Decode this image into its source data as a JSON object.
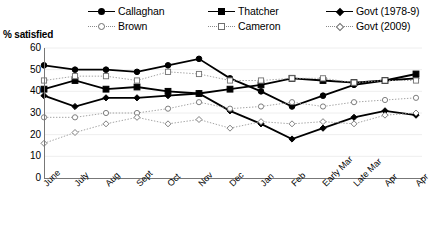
{
  "axis_title": "% satisfied",
  "legend": {
    "rows": [
      [
        {
          "label": "Callaghan",
          "marker": "f-circle",
          "line": "solid"
        },
        {
          "label": "Thatcher",
          "marker": "f-square",
          "line": "solid"
        },
        {
          "label": "Govt (1978-9)",
          "marker": "f-diamond",
          "line": "solid"
        }
      ],
      [
        {
          "label": "Brown",
          "marker": "o-circle",
          "line": "dot"
        },
        {
          "label": "Cameron",
          "marker": "o-square",
          "line": "dot"
        },
        {
          "label": "Govt (2009)",
          "marker": "o-diamond",
          "line": "dot"
        }
      ]
    ]
  },
  "chart_data": {
    "type": "line",
    "title": "",
    "xlabel": "",
    "ylabel": "% satisfied",
    "ylim": [
      0,
      60
    ],
    "yticks": [
      0,
      10,
      20,
      30,
      40,
      50,
      60
    ],
    "grid": true,
    "legend_position": "top",
    "categories": [
      "June",
      "July",
      "Aug",
      "Sept",
      "Oct",
      "Nov",
      "Dec",
      "Jan",
      "Feb",
      "Early Mar",
      "Late Mar",
      "Apr",
      "Apr"
    ],
    "series": [
      {
        "name": "Callaghan",
        "marker": "f-circle",
        "line": "solid",
        "values": [
          52,
          50,
          50,
          49,
          52,
          55,
          46,
          40,
          33,
          38,
          43,
          45,
          46
        ]
      },
      {
        "name": "Thatcher",
        "marker": "f-square",
        "line": "solid",
        "values": [
          41,
          45,
          41,
          42,
          40,
          39,
          41,
          43,
          46,
          45,
          44,
          45,
          48
        ]
      },
      {
        "name": "Govt (1978-9)",
        "marker": "f-diamond",
        "line": "solid",
        "values": [
          38,
          33,
          37,
          37,
          38,
          39,
          31,
          25,
          18,
          23,
          28,
          31,
          29
        ]
      },
      {
        "name": "Brown",
        "marker": "o-circle",
        "line": "dot",
        "values": [
          28,
          28,
          30,
          30,
          32,
          35,
          32,
          33,
          35,
          33,
          35,
          36,
          37
        ]
      },
      {
        "name": "Cameron",
        "marker": "o-square",
        "line": "dot",
        "values": [
          45,
          47,
          47,
          45,
          49,
          48,
          45,
          45,
          46,
          46,
          44,
          45,
          45
        ]
      },
      {
        "name": "Govt (2009)",
        "marker": "o-diamond",
        "line": "dot",
        "values": [
          16,
          21,
          25,
          28,
          25,
          27,
          23,
          26,
          25,
          26,
          25,
          29,
          30
        ]
      }
    ]
  }
}
